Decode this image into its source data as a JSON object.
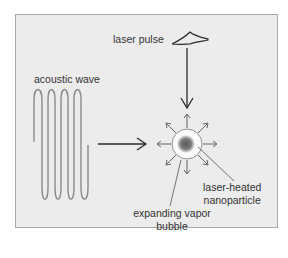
{
  "labels": {
    "laser_pulse": "laser pulse",
    "acoustic_wave": "acoustic wave",
    "nanoparticle_line1": "laser-heated",
    "nanoparticle_line2": "nanoparticle",
    "bubble_line1": "expanding vapor",
    "bubble_line2": "bubble"
  },
  "colors": {
    "background": "#ececec",
    "frame_border": "#a8a8a8",
    "wave": "#8a8a8a",
    "arrow": "#2a2a2a",
    "bubble_fill": "#fafafa",
    "nanoparticle": "#6e6e6e",
    "text": "#333333"
  }
}
